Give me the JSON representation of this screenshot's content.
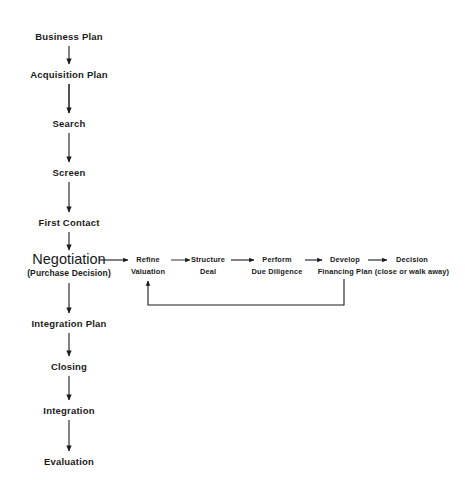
{
  "diagram": {
    "background_color": "#ffffff",
    "line_color": "#1a1a1a",
    "text_color": "#1a1a1a",
    "main_flow": [
      {
        "id": "business-plan",
        "label": "Business Plan",
        "x": 69,
        "y": 38
      },
      {
        "id": "acquisition-plan",
        "label": "Acquisition Plan",
        "x": 69,
        "y": 76
      },
      {
        "id": "search",
        "label": "Search",
        "x": 69,
        "y": 125
      },
      {
        "id": "screen",
        "label": "Screen",
        "x": 69,
        "y": 174
      },
      {
        "id": "first-contact",
        "label": "First Contact",
        "x": 69,
        "y": 224
      },
      {
        "id": "negotiation",
        "label": "Negotiation",
        "sublabel": "(Purchase Decision)",
        "x": 69,
        "y": 264,
        "emphasis": "large"
      },
      {
        "id": "integration-plan",
        "label": "Integration Plan",
        "x": 69,
        "y": 325
      },
      {
        "id": "closing",
        "label": "Closing",
        "x": 69,
        "y": 368
      },
      {
        "id": "integration",
        "label": "Integration",
        "x": 69,
        "y": 412
      },
      {
        "id": "evaluation",
        "label": "Evaluation",
        "x": 69,
        "y": 463
      }
    ],
    "branch_flow": [
      {
        "id": "refine-valuation",
        "line1": "Refine",
        "line2": "Valuation",
        "x": 148,
        "y": 258
      },
      {
        "id": "structure-deal",
        "line1": "Structure",
        "line2": "Deal",
        "x": 208,
        "y": 258
      },
      {
        "id": "perform-due-diligence",
        "line1": "Perform",
        "line2": "Due Diligence",
        "x": 275,
        "y": 258
      },
      {
        "id": "develop-financing-plan",
        "line1": "Develop",
        "line2": "Financing Plan",
        "x": 344,
        "y": 258
      },
      {
        "id": "decision",
        "line1": "Decision",
        "line2": "(close or walk away)",
        "x": 411,
        "y": 258
      }
    ],
    "feedback_loop": {
      "id": "feedback-loop",
      "label": "Feedback loop from Develop Financing Plan back to Refine Valuation",
      "from": "develop-financing-plan",
      "to": "refine-valuation"
    }
  }
}
